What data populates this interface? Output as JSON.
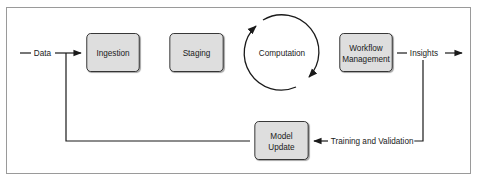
{
  "diagram": {
    "input_label": "Data",
    "output_label": "Insights",
    "feedback_label": "Training and Validation",
    "stages": {
      "ingestion": "Ingestion",
      "staging": "Staging",
      "computation": "Computation",
      "workflow_line1": "Workflow",
      "workflow_line2": "Management",
      "model_line1": "Model",
      "model_line2": "Update"
    },
    "colors": {
      "box_fill": "#dedede",
      "box_border": "#2a2a2a",
      "line": "#1a1a1a",
      "frame_border": "#9a9a9a"
    }
  }
}
